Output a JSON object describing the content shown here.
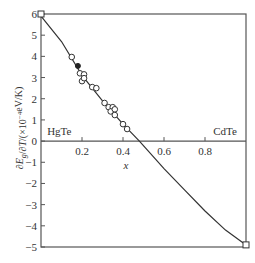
{
  "chart_data": {
    "type": "scatter",
    "title": "",
    "xlabel": "x",
    "ylabel": "∂E_g/∂T/(×10⁻⁴eV/K)",
    "xlim": [
      0,
      1.0
    ],
    "ylim": [
      -5,
      6
    ],
    "x_ticks": [
      0.2,
      0.4,
      0.6,
      0.8
    ],
    "x_tick_labels": [
      "0.2",
      "0.4",
      "0.6",
      "0.8"
    ],
    "y_ticks": [
      -5,
      -4,
      -3,
      -2,
      -1,
      0,
      1,
      2,
      3,
      4,
      5,
      6
    ],
    "y_tick_labels": [
      "−5",
      "−4",
      "−3",
      "−2",
      "−1",
      "0",
      "1",
      "2",
      "3",
      "4",
      "5",
      "6"
    ],
    "grid": false,
    "annotations": [
      {
        "text": "HgTe",
        "x": 0.03,
        "y": 0.3
      },
      {
        "text": "CdTe",
        "x": 0.84,
        "y": 0.3
      }
    ],
    "series": [
      {
        "name": "fit curve",
        "type": "line",
        "x": [
          0.0,
          0.1,
          0.2,
          0.3,
          0.4,
          0.48,
          0.6,
          0.7,
          0.8,
          0.9,
          1.0
        ],
        "y": [
          5.9,
          4.7,
          3.1,
          1.9,
          0.8,
          0.0,
          -1.3,
          -2.3,
          -3.3,
          -4.2,
          -4.9
        ]
      },
      {
        "name": "endpoints (open squares)",
        "type": "scatter",
        "marker": "square-open",
        "x": [
          0.0,
          1.0
        ],
        "y": [
          6.0,
          -4.9
        ]
      },
      {
        "name": "experimental (open circles)",
        "type": "scatter",
        "marker": "circle-open",
        "x": [
          0.15,
          0.19,
          0.21,
          0.2,
          0.21,
          0.25,
          0.27,
          0.31,
          0.33,
          0.35,
          0.34,
          0.36,
          0.36,
          0.4,
          0.42
        ],
        "y": [
          3.97,
          3.2,
          3.15,
          2.83,
          2.97,
          2.55,
          2.5,
          1.8,
          1.6,
          1.6,
          1.4,
          1.5,
          1.23,
          0.8,
          0.57
        ]
      },
      {
        "name": "experimental (filled)",
        "type": "scatter",
        "marker": "circle-filled",
        "x": [
          0.18
        ],
        "y": [
          3.55
        ]
      }
    ]
  }
}
